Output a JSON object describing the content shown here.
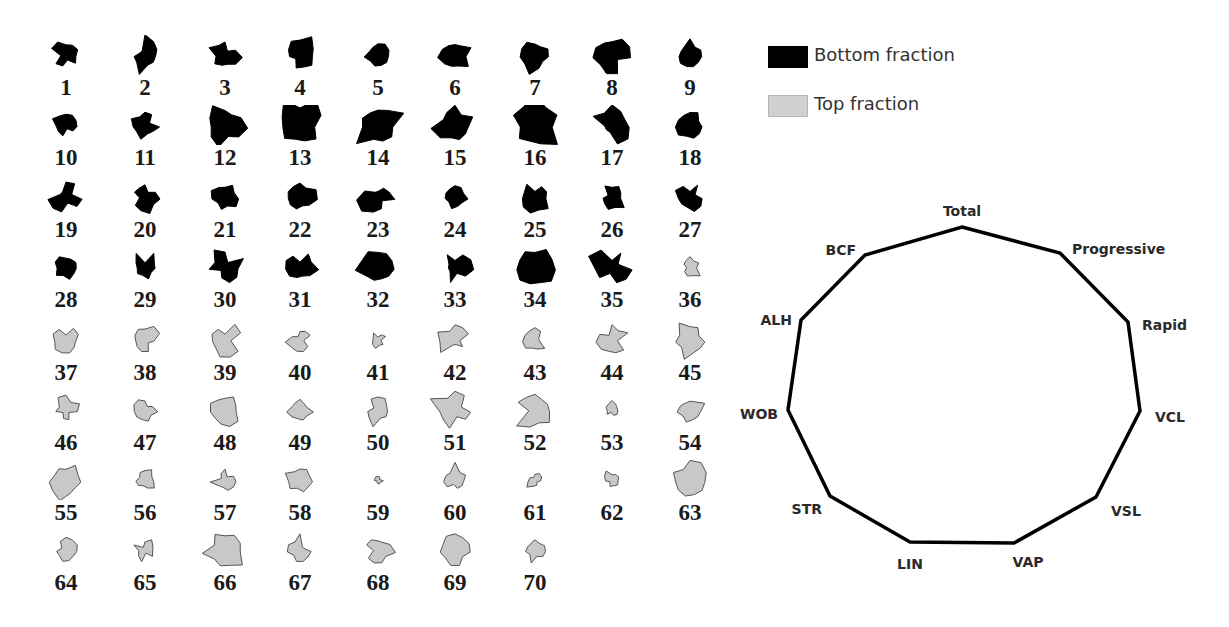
{
  "legend": {
    "items": [
      {
        "label": "Bottom fraction",
        "color": "#000000"
      },
      {
        "label": "Top fraction",
        "color": "#c8c8c8"
      }
    ]
  },
  "radar": {
    "axes": [
      "Total",
      "Progressive",
      "Rapid",
      "VCL",
      "VSL",
      "VAP",
      "LIN",
      "STR",
      "WOB",
      "ALH",
      "BCF"
    ]
  },
  "chart_data": {
    "type": "radar-glyph-grid",
    "title": "",
    "grid": {
      "columns": 9,
      "rows": 8,
      "count": 70
    },
    "legend": [
      {
        "label": "Bottom fraction",
        "color": "#000000",
        "samples": "1-35"
      },
      {
        "label": "Top fraction",
        "color": "#c8c8c8",
        "samples": "36-70"
      }
    ],
    "axes": [
      "Total",
      "Progressive",
      "Rapid",
      "VCL",
      "VSL",
      "VAP",
      "LIN",
      "STR",
      "WOB",
      "ALH",
      "BCF"
    ],
    "samples": [
      {
        "id": 1,
        "fraction": "Bottom"
      },
      {
        "id": 2,
        "fraction": "Bottom"
      },
      {
        "id": 3,
        "fraction": "Bottom"
      },
      {
        "id": 4,
        "fraction": "Bottom"
      },
      {
        "id": 5,
        "fraction": "Bottom"
      },
      {
        "id": 6,
        "fraction": "Bottom"
      },
      {
        "id": 7,
        "fraction": "Bottom"
      },
      {
        "id": 8,
        "fraction": "Bottom"
      },
      {
        "id": 9,
        "fraction": "Bottom"
      },
      {
        "id": 10,
        "fraction": "Bottom"
      },
      {
        "id": 11,
        "fraction": "Bottom"
      },
      {
        "id": 12,
        "fraction": "Bottom"
      },
      {
        "id": 13,
        "fraction": "Bottom"
      },
      {
        "id": 14,
        "fraction": "Bottom"
      },
      {
        "id": 15,
        "fraction": "Bottom"
      },
      {
        "id": 16,
        "fraction": "Bottom"
      },
      {
        "id": 17,
        "fraction": "Bottom"
      },
      {
        "id": 18,
        "fraction": "Bottom"
      },
      {
        "id": 19,
        "fraction": "Bottom"
      },
      {
        "id": 20,
        "fraction": "Bottom"
      },
      {
        "id": 21,
        "fraction": "Bottom"
      },
      {
        "id": 22,
        "fraction": "Bottom"
      },
      {
        "id": 23,
        "fraction": "Bottom"
      },
      {
        "id": 24,
        "fraction": "Bottom"
      },
      {
        "id": 25,
        "fraction": "Bottom"
      },
      {
        "id": 26,
        "fraction": "Bottom"
      },
      {
        "id": 27,
        "fraction": "Bottom"
      },
      {
        "id": 28,
        "fraction": "Bottom"
      },
      {
        "id": 29,
        "fraction": "Bottom"
      },
      {
        "id": 30,
        "fraction": "Bottom"
      },
      {
        "id": 31,
        "fraction": "Bottom"
      },
      {
        "id": 32,
        "fraction": "Bottom"
      },
      {
        "id": 33,
        "fraction": "Bottom"
      },
      {
        "id": 34,
        "fraction": "Bottom"
      },
      {
        "id": 35,
        "fraction": "Bottom"
      },
      {
        "id": 36,
        "fraction": "Top"
      },
      {
        "id": 37,
        "fraction": "Top"
      },
      {
        "id": 38,
        "fraction": "Top"
      },
      {
        "id": 39,
        "fraction": "Top"
      },
      {
        "id": 40,
        "fraction": "Top"
      },
      {
        "id": 41,
        "fraction": "Top"
      },
      {
        "id": 42,
        "fraction": "Top"
      },
      {
        "id": 43,
        "fraction": "Top"
      },
      {
        "id": 44,
        "fraction": "Top"
      },
      {
        "id": 45,
        "fraction": "Top"
      },
      {
        "id": 46,
        "fraction": "Top"
      },
      {
        "id": 47,
        "fraction": "Top"
      },
      {
        "id": 48,
        "fraction": "Top"
      },
      {
        "id": 49,
        "fraction": "Top"
      },
      {
        "id": 50,
        "fraction": "Top"
      },
      {
        "id": 51,
        "fraction": "Top"
      },
      {
        "id": 52,
        "fraction": "Top"
      },
      {
        "id": 53,
        "fraction": "Top"
      },
      {
        "id": 54,
        "fraction": "Top"
      },
      {
        "id": 55,
        "fraction": "Top"
      },
      {
        "id": 56,
        "fraction": "Top"
      },
      {
        "id": 57,
        "fraction": "Top"
      },
      {
        "id": 58,
        "fraction": "Top"
      },
      {
        "id": 59,
        "fraction": "Top"
      },
      {
        "id": 60,
        "fraction": "Top"
      },
      {
        "id": 61,
        "fraction": "Top"
      },
      {
        "id": 62,
        "fraction": "Top"
      },
      {
        "id": 63,
        "fraction": "Top"
      },
      {
        "id": 64,
        "fraction": "Top"
      },
      {
        "id": 65,
        "fraction": "Top"
      },
      {
        "id": 66,
        "fraction": "Top"
      },
      {
        "id": 67,
        "fraction": "Top"
      },
      {
        "id": 68,
        "fraction": "Top"
      },
      {
        "id": 69,
        "fraction": "Top"
      },
      {
        "id": 70,
        "fraction": "Top"
      }
    ]
  }
}
